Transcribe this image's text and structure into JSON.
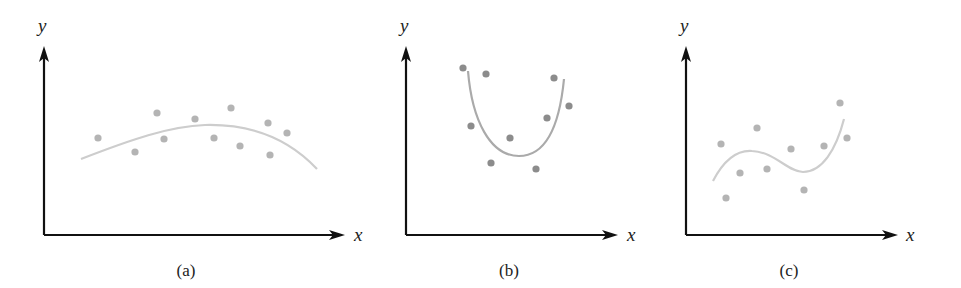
{
  "chart_data": [
    {
      "type": "scatter",
      "caption": "(a)",
      "xlabel": "x",
      "ylabel": "y",
      "description": "Scatter points with a fitted concave-down (quadratic) curve",
      "origin": [
        44,
        235
      ],
      "point_color": "#b4b4b4",
      "curve_color": "#cdcdcd",
      "points": [
        [
          98,
          138
        ],
        [
          135,
          152
        ],
        [
          157,
          113
        ],
        [
          164,
          139
        ],
        [
          195,
          119
        ],
        [
          214,
          138
        ],
        [
          231,
          108
        ],
        [
          240,
          146
        ],
        [
          268,
          123
        ],
        [
          287,
          133
        ],
        [
          270,
          155
        ]
      ],
      "curve_path": "M81,159 C130,140 170,126 205,125 C245,124 285,135 317,169"
    },
    {
      "type": "scatter",
      "caption": "(b)",
      "xlabel": "x",
      "ylabel": "y",
      "description": "Scatter points with a fitted concave-up (U-shaped) curve",
      "origin": [
        406,
        235
      ],
      "point_color": "#8c8c8c",
      "curve_color": "#aaaaaa",
      "points": [
        [
          463,
          68
        ],
        [
          486,
          74
        ],
        [
          554,
          78
        ],
        [
          569,
          106
        ],
        [
          547,
          118
        ],
        [
          471,
          126
        ],
        [
          510,
          138
        ],
        [
          491,
          163
        ],
        [
          536,
          169
        ]
      ],
      "curve_path": "M468,71 C472,120 490,156 519,156 C548,156 560,120 564,79"
    },
    {
      "type": "scatter",
      "caption": "(c)",
      "xlabel": "x",
      "ylabel": "y",
      "description": "Scatter points with a fitted cubic curve",
      "origin": [
        686,
        235
      ],
      "point_color": "#b4b4b4",
      "curve_color": "#cdcdcd",
      "points": [
        [
          721,
          144
        ],
        [
          757,
          128
        ],
        [
          740,
          173
        ],
        [
          726,
          198
        ],
        [
          767,
          169
        ],
        [
          791,
          149
        ],
        [
          804,
          190
        ],
        [
          824,
          146
        ],
        [
          840,
          103
        ],
        [
          847,
          138
        ]
      ],
      "curve_path": "M713,181 C725,158 738,150 752,151 C775,152 788,172 803,172 C822,172 836,150 844,119"
    }
  ],
  "panels": [
    {
      "caption": "(a)",
      "xlabel": "x",
      "ylabel": "y"
    },
    {
      "caption": "(b)",
      "xlabel": "x",
      "ylabel": "y"
    },
    {
      "caption": "(c)",
      "xlabel": "x",
      "ylabel": "y"
    }
  ]
}
